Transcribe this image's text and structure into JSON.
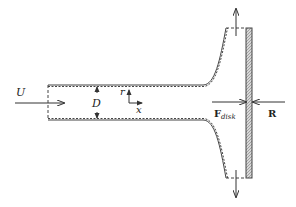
{
  "diagram": {
    "type": "actuator-disk-stream-tube",
    "labels": {
      "inflow_velocity": "U",
      "diameter": "D",
      "radial_axis": "r",
      "axial_axis": "x",
      "disk_force_main": "F",
      "disk_force_sub": "disk",
      "reaction_force": "R"
    },
    "colors": {
      "stroke": "#333333",
      "hatch": "#9a9a9a",
      "background": "#ffffff"
    }
  }
}
